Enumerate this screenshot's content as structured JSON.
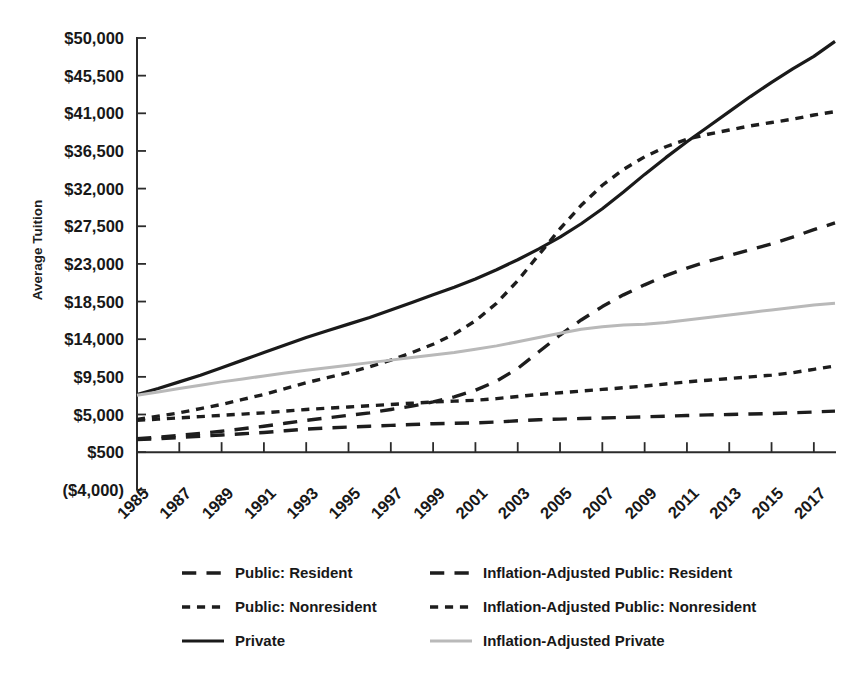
{
  "chart_data": {
    "type": "line",
    "title": "",
    "xlabel": "",
    "ylabel": "Average Tuition",
    "grid": false,
    "legend_position": "bottom",
    "ylim": [
      -4000,
      50000
    ],
    "xlim": [
      1985,
      2018
    ],
    "ytick_labels": [
      "$50,000",
      "$45,500",
      "$41,000",
      "$36,500",
      "$32,000",
      "$27,500",
      "$23,000",
      "$18,500",
      "$14,000",
      "$9,500",
      "$5,000",
      "$500",
      "($4,000)"
    ],
    "ytick_values": [
      50000,
      45500,
      41000,
      36500,
      32000,
      27500,
      23000,
      18500,
      14000,
      9500,
      5000,
      500,
      -4000
    ],
    "xtick_labels": [
      "1985",
      "1987",
      "1989",
      "1991",
      "1993",
      "1995",
      "1997",
      "1999",
      "2001",
      "2003",
      "2005",
      "2007",
      "2009",
      "2011",
      "2013",
      "2015",
      "2017"
    ],
    "xtick_values": [
      1985,
      1987,
      1989,
      1991,
      1993,
      1995,
      1997,
      1999,
      2001,
      2003,
      2005,
      2007,
      2009,
      2011,
      2013,
      2015,
      2017
    ],
    "x": [
      1985,
      1986,
      1987,
      1988,
      1989,
      1990,
      1991,
      1992,
      1993,
      1994,
      1995,
      1996,
      1997,
      1998,
      1999,
      2000,
      2001,
      2002,
      2003,
      2004,
      2005,
      2006,
      2007,
      2008,
      2009,
      2010,
      2011,
      2012,
      2013,
      2014,
      2015,
      2016,
      2017,
      2018
    ],
    "series": [
      {
        "name": "Public: Resident",
        "style": "long-dash",
        "color": "#1d1d1d",
        "values": [
          2000,
          2100,
          2250,
          2400,
          2550,
          2700,
          2850,
          3050,
          3250,
          3400,
          3500,
          3600,
          3700,
          3800,
          3900,
          3950,
          4000,
          4100,
          4250,
          4380,
          4450,
          4520,
          4580,
          4650,
          4720,
          4800,
          4880,
          4950,
          5000,
          5060,
          5120,
          5200,
          5300,
          5400
        ]
      },
      {
        "name": "Public: Nonresident",
        "style": "long-dash",
        "color": "#1d1d1d",
        "values": [
          2100,
          2300,
          2500,
          2750,
          3000,
          3300,
          3600,
          3950,
          4300,
          4600,
          4900,
          5200,
          5600,
          6000,
          6500,
          7100,
          7900,
          9000,
          10500,
          12500,
          14500,
          16300,
          17900,
          19300,
          20500,
          21600,
          22500,
          23300,
          24000,
          24700,
          25400,
          26200,
          27100,
          27900
        ]
      },
      {
        "name": "Private",
        "style": "solid",
        "color": "#1a1a1a",
        "values": [
          7400,
          8100,
          8900,
          9700,
          10600,
          11500,
          12400,
          13300,
          14200,
          15000,
          15800,
          16600,
          17500,
          18400,
          19300,
          20200,
          21200,
          22300,
          23500,
          24800,
          26200,
          27800,
          29600,
          31600,
          33700,
          35700,
          37600,
          39400,
          41200,
          43000,
          44700,
          46300,
          47800,
          49600
        ]
      },
      {
        "name": "Inflation-Adjusted Public: Resident",
        "style": "short-dash",
        "color": "#1d1d1d",
        "values": [
          4300,
          4450,
          4600,
          4750,
          4900,
          5050,
          5200,
          5400,
          5600,
          5750,
          5900,
          6050,
          6200,
          6350,
          6500,
          6600,
          6700,
          6900,
          7150,
          7400,
          7600,
          7800,
          8000,
          8200,
          8400,
          8650,
          8900,
          9100,
          9300,
          9500,
          9700,
          10000,
          10400,
          10800
        ]
      },
      {
        "name": "Inflation-Adjusted Public: Nonresident",
        "style": "short-dash",
        "color": "#1d1d1d",
        "values": [
          4400,
          4800,
          5200,
          5700,
          6200,
          6800,
          7400,
          8100,
          8800,
          9400,
          10000,
          10700,
          11500,
          12400,
          13400,
          14600,
          16200,
          18300,
          21000,
          24100,
          27200,
          30000,
          32400,
          34300,
          35800,
          37000,
          37900,
          38500,
          39000,
          39500,
          39900,
          40300,
          40800,
          41200
        ]
      },
      {
        "name": "Inflation-Adjusted Private",
        "style": "solid",
        "color": "#b9b9b9",
        "values": [
          7300,
          7700,
          8100,
          8500,
          8900,
          9250,
          9600,
          9950,
          10300,
          10600,
          10900,
          11200,
          11500,
          11800,
          12100,
          12400,
          12800,
          13200,
          13700,
          14200,
          14700,
          15200,
          15500,
          15700,
          15800,
          16000,
          16300,
          16600,
          16900,
          17200,
          17500,
          17800,
          18100,
          18300
        ]
      }
    ],
    "legend_entries": [
      {
        "label": "Public: Resident",
        "style": "long-dash",
        "color": "#1d1d1d"
      },
      {
        "label": "Inflation-Adjusted Public: Resident",
        "style": "long-dash",
        "color": "#1d1d1d"
      },
      {
        "label": "Public: Nonresident",
        "style": "short-dash",
        "color": "#1d1d1d"
      },
      {
        "label": "Inflation-Adjusted Public: Nonresident",
        "style": "short-dash",
        "color": "#1d1d1d"
      },
      {
        "label": "Private",
        "style": "solid",
        "color": "#1a1a1a"
      },
      {
        "label": "Inflation-Adjusted Private",
        "style": "solid",
        "color": "#b9b9b9"
      }
    ]
  }
}
